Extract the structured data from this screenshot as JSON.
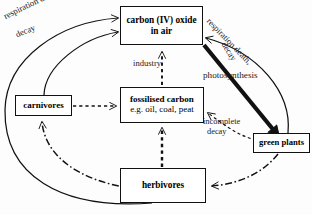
{
  "diagram": {
    "nodes": {
      "co2": {
        "line1": "carbon (IV) oxide",
        "line2": "in air"
      },
      "fossil": {
        "line1": "fossilised carbon",
        "line2": "e.g. oil, coal, peat"
      },
      "carnivores": {
        "line1": "carnivores",
        "line2": ""
      },
      "herbivores": {
        "line1": "herbivores",
        "line2": ""
      },
      "plants": {
        "line1": "green plants",
        "line2": ""
      }
    },
    "labels": {
      "industry": "industry",
      "photosynthesis": "photosynthesis",
      "incomplete_1": "incomplete",
      "incomplete_2": "decay",
      "resp_left_1": "respiration death,",
      "resp_left_2": "decay",
      "resp_right_1": "respiration death,",
      "resp_right_2": "decay"
    },
    "edges": [
      {
        "from": "herbivores",
        "to": "co2",
        "style": "solid",
        "label": "respiration death, decay"
      },
      {
        "from": "carnivores",
        "to": "co2",
        "style": "solid",
        "label": "respiration death, decay"
      },
      {
        "from": "plants",
        "to": "co2",
        "style": "solid",
        "label": "respiration death, decay"
      },
      {
        "from": "fossil",
        "to": "co2",
        "style": "dashed",
        "label": "industry"
      },
      {
        "from": "co2",
        "to": "plants",
        "style": "thick",
        "label": "photosynthesis"
      },
      {
        "from": "plants",
        "to": "fossil",
        "style": "dashed",
        "label": "incomplete decay"
      },
      {
        "from": "herbivores",
        "to": "fossil",
        "style": "dashed",
        "label": ""
      },
      {
        "from": "carnivores",
        "to": "fossil",
        "style": "dashed",
        "label": ""
      },
      {
        "from": "plants",
        "to": "herbivores",
        "style": "dashdot",
        "label": ""
      },
      {
        "from": "herbivores",
        "to": "carnivores",
        "style": "dashdot",
        "label": ""
      }
    ],
    "colors": {
      "stroke": "#111111",
      "fill": "#ffffff",
      "text": "#000000"
    }
  }
}
